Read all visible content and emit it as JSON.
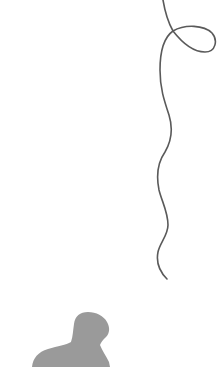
{
  "scene": {
    "description": "Line illustration of a long looping string descending from top, with a grey silhouette of a person's head and shoulders at bottom-left",
    "background_color": "#ffffff",
    "string": {
      "color": "#5a5a5a",
      "stroke_width": 1.6,
      "has_loop": true
    },
    "silhouette": {
      "color": "#9a9a9a",
      "subject": "person head and shoulders"
    }
  }
}
